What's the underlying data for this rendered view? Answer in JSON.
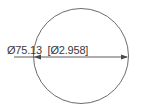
{
  "drawing": {
    "title": "circle-diameter-dimension",
    "background_color": "#ffffff",
    "line_color": "#555555",
    "text_color": "#3a3a3a",
    "geometry": {
      "circle": {
        "center_x": 81,
        "center_y": 56,
        "radius": 48,
        "stroke_width": 0.9
      },
      "dimension_line": {
        "y": 57,
        "x_start": 34,
        "x_end": 128,
        "arrow_left": true,
        "arrow_right": true
      },
      "leader_line": {
        "x_start": 14,
        "x_end": 34,
        "y": 57
      },
      "text_underline": {
        "x_start": 14,
        "x_end": 112,
        "y": 57
      }
    },
    "dimension": {
      "full_label": "Ø75.13  [Ø2.958]",
      "metric": {
        "symbol": "Ø",
        "value": "75.13",
        "unit": "mm"
      },
      "imperial": {
        "symbol": "Ø",
        "value": "2.958",
        "unit": "in",
        "bracket_open": "[",
        "bracket_close": "]"
      }
    }
  }
}
